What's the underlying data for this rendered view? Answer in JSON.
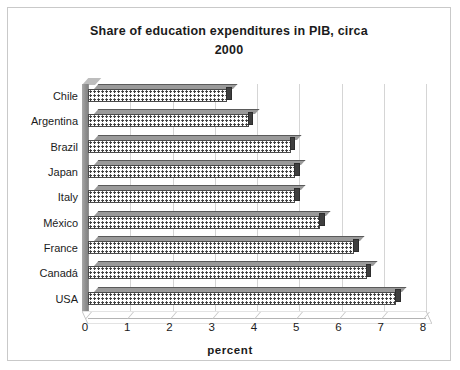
{
  "chart_data": {
    "type": "bar",
    "orientation": "horizontal",
    "title": "Share of education expenditures in PIB, circa 2000",
    "title_line1": "Share of education expenditures in PIB, circa",
    "title_line2": "2000",
    "xlabel": "percent",
    "ylabel": "",
    "xlim": [
      0,
      8
    ],
    "xticks": [
      "0",
      "1",
      "2",
      "3",
      "4",
      "5",
      "6",
      "7",
      "8"
    ],
    "grid": "vertical",
    "legend": "none",
    "categories": [
      "Chile",
      "Argentina",
      "Brazil",
      "Japan",
      "Italy",
      "México",
      "France",
      "Canadá",
      "USA"
    ],
    "values": [
      3.3,
      3.8,
      4.8,
      4.9,
      4.9,
      5.5,
      6.3,
      6.6,
      7.3
    ],
    "bars": [
      {
        "label": "Chile",
        "value": 3.3
      },
      {
        "label": "Argentina",
        "value": 3.8
      },
      {
        "label": "Brazil",
        "value": 4.8
      },
      {
        "label": "Japan",
        "value": 4.9
      },
      {
        "label": "Italy",
        "value": 4.9
      },
      {
        "label": "México",
        "value": 5.5
      },
      {
        "label": "France",
        "value": 6.3
      },
      {
        "label": "Canadá",
        "value": 6.6
      },
      {
        "label": "USA",
        "value": 7.3
      }
    ],
    "colors": {
      "bar_fill": "#ffffff",
      "bar_pattern": "#3a3a3a",
      "bar_outline": "#4a4a4a",
      "bar_cap": "#3f3f3f",
      "bar_top": "#9a9a9a",
      "gridline": "#d5d5d5",
      "frame": "#c9c9c9",
      "text": "#1b1b1b",
      "background": "#ffffff"
    }
  }
}
